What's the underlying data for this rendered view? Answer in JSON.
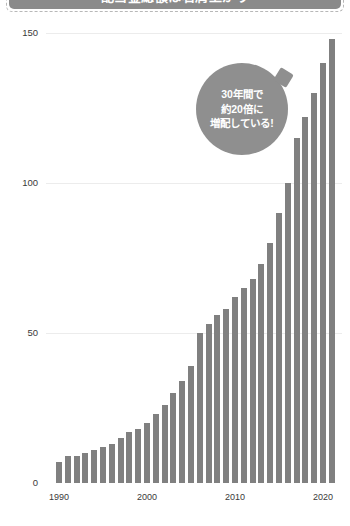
{
  "header": {
    "title": "配当金総額は右肩上がり"
  },
  "callout": {
    "line1": "30年間で",
    "line2": "約20倍に",
    "line3": "増配している!"
  },
  "colors": {
    "bar": "#808080",
    "bubble": "#8f8f8f",
    "banner": "#8a8a8a",
    "grid": "#ececec",
    "text": "#3a3a3a"
  },
  "chart_data": {
    "type": "bar",
    "title": "配当金総額は右肩上がり",
    "xlabel": "",
    "ylabel": "",
    "ylim": [
      0,
      155
    ],
    "yticks": [
      0,
      50,
      100,
      150
    ],
    "ytick_labels": [
      "0",
      "50",
      "100",
      "150"
    ],
    "xticks": [
      1990,
      2000,
      2010,
      2020
    ],
    "xtick_labels": [
      "1990",
      "2000",
      "2010",
      "2020"
    ],
    "grid": true,
    "legend": "none",
    "annotations": [
      "30年間で 約20倍に 増配している!"
    ],
    "categories": [
      1990,
      1991,
      1992,
      1993,
      1994,
      1995,
      1996,
      1997,
      1998,
      1999,
      2000,
      2001,
      2002,
      2003,
      2004,
      2005,
      2006,
      2007,
      2008,
      2009,
      2010,
      2011,
      2012,
      2013,
      2014,
      2015,
      2016,
      2017,
      2018,
      2019,
      2020,
      2021
    ],
    "values": [
      7,
      9,
      9,
      10,
      11,
      12,
      13,
      15,
      17,
      18,
      20,
      23,
      26,
      30,
      34,
      39,
      50,
      53,
      56,
      58,
      62,
      65,
      68,
      73,
      80,
      90,
      100,
      115,
      122,
      130,
      140,
      148
    ]
  }
}
